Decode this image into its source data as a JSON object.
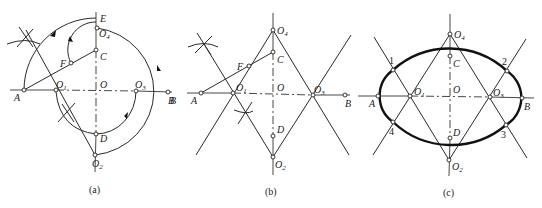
{
  "figure": {
    "panels": [
      {
        "id": "a",
        "caption": "(a)",
        "labels": {
          "A": "A",
          "B": "B",
          "O": "O",
          "C": "C",
          "D": "D",
          "E": "E",
          "F": "F",
          "O1": "O",
          "O1_sub": "1",
          "O2": "O",
          "O2_sub": "2",
          "O3": "O",
          "O3_sub": "3",
          "O4": "O",
          "O4_sub": "4"
        }
      },
      {
        "id": "b",
        "caption": "(b)",
        "labels": {
          "A": "A",
          "B": "B",
          "O": "O",
          "C": "C",
          "D": "D",
          "F": "F",
          "O1": "O",
          "O1_sub": "1",
          "O2": "O",
          "O2_sub": "2",
          "O3": "O",
          "O3_sub": "3",
          "O4": "O",
          "O4_sub": "4"
        }
      },
      {
        "id": "c",
        "caption": "(c)",
        "labels": {
          "A": "A",
          "B": "B",
          "O": "O",
          "C": "C",
          "D": "D",
          "O1": "O",
          "O1_sub": "1",
          "O2": "O",
          "O2_sub": "2",
          "O3": "O",
          "O3_sub": "3",
          "O4": "O",
          "O4_sub": "4",
          "p1": "1",
          "p2": "2",
          "p3": "3",
          "p4": "4"
        }
      }
    ],
    "colors": {
      "line": "#2a2a2a",
      "background": "#ffffff"
    }
  }
}
